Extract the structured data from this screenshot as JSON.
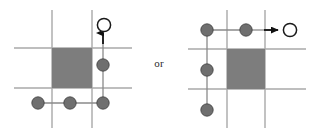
{
  "figure": {
    "width": 318,
    "height": 134,
    "background": "#ffffff",
    "connector_label": "or",
    "colors": {
      "grid_line": "#a8a8a8",
      "square_fill": "#7d7d7d",
      "node_fill": "#6f6f6f",
      "node_stroke": "#3f3f3f",
      "open_node_fill": "#ffffff",
      "open_node_stroke": "#1a1a1a",
      "edge": "#8a8a8a",
      "arrow": "#111111",
      "label_text": "#2b2b2b"
    },
    "geometry": {
      "grid_line_width": 1.4,
      "edge_line_width": 1.3,
      "filled_node_radius": 6.2,
      "open_node_radius": 6.6,
      "open_node_stroke_width": 1.5
    }
  },
  "panels": [
    {
      "id": "left",
      "name": "left-configuration",
      "grid": {
        "vertical_lines_x": [
          52,
          92
        ],
        "horizontal_lines_y": [
          48,
          88
        ],
        "extent": {
          "x0": 14,
          "x1": 132,
          "y0": 10,
          "y1": 128
        }
      },
      "shaded_square": {
        "x": 52,
        "y": 48,
        "width": 40,
        "height": 40
      },
      "edges": [
        {
          "name": "bottom-row-edge",
          "x1": 38,
          "y1": 103,
          "x2": 103,
          "y2": 103
        },
        {
          "name": "right-column-edge",
          "x1": 103,
          "y1": 103,
          "x2": 103,
          "y2": 65
        },
        {
          "name": "arrow-shaft",
          "x1": 103,
          "y1": 65,
          "x2": 103,
          "y2": 34
        }
      ],
      "filled_nodes": [
        {
          "name": "node-bottom-left",
          "cx": 38,
          "cy": 103
        },
        {
          "name": "node-bottom-middle",
          "cx": 70,
          "cy": 103
        },
        {
          "name": "node-bottom-right",
          "cx": 103,
          "cy": 103
        },
        {
          "name": "node-middle-right",
          "cx": 103,
          "cy": 65
        }
      ],
      "open_nodes": [
        {
          "name": "node-target-open",
          "cx": 104,
          "cy": 25
        }
      ],
      "arrow": {
        "name": "arrow-up",
        "direction": "up",
        "from": {
          "x": 103,
          "y": 48
        },
        "to": {
          "x": 103,
          "y": 33
        }
      }
    },
    {
      "id": "right",
      "name": "right-configuration",
      "grid": {
        "vertical_lines_x": [
          227,
          265
        ],
        "horizontal_lines_y": [
          49,
          89
        ],
        "extent": {
          "x0": 188,
          "x1": 306,
          "y0": 10,
          "y1": 128
        }
      },
      "shaded_square": {
        "x": 227,
        "y": 49,
        "width": 38,
        "height": 40
      },
      "edges": [
        {
          "name": "top-row-edge",
          "x1": 207,
          "y1": 30,
          "x2": 246,
          "y2": 30
        },
        {
          "name": "left-column-edge-upper",
          "x1": 207,
          "y1": 30,
          "x2": 207,
          "y2": 70
        },
        {
          "name": "left-column-edge-lower",
          "x1": 207,
          "y1": 70,
          "x2": 207,
          "y2": 110
        },
        {
          "name": "arrow-shaft",
          "x1": 246,
          "y1": 30,
          "x2": 276,
          "y2": 30
        }
      ],
      "filled_nodes": [
        {
          "name": "node-top-left",
          "cx": 207,
          "cy": 30
        },
        {
          "name": "node-top-middle",
          "cx": 246,
          "cy": 30
        },
        {
          "name": "node-middle-left",
          "cx": 207,
          "cy": 70
        },
        {
          "name": "node-bottom-left",
          "cx": 207,
          "cy": 110
        }
      ],
      "open_nodes": [
        {
          "name": "node-target-open",
          "cx": 290,
          "cy": 30
        }
      ],
      "arrow": {
        "name": "arrow-right",
        "direction": "right",
        "from": {
          "x": 258,
          "y": 30
        },
        "to": {
          "x": 278,
          "y": 30
        }
      }
    }
  ]
}
